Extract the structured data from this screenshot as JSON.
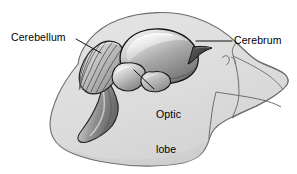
{
  "figure": {
    "name": "bird-brain-anatomy",
    "width": 297,
    "height": 174,
    "background_color": "#ffffff"
  },
  "labels": {
    "cerebellum": "Cerebellum",
    "cerebrum": "Cerebrum",
    "optic_lobe_line1": "Optic",
    "optic_lobe_line2": "lobe"
  },
  "colors": {
    "outline": "#5a5a5a",
    "head_fill": "#dcdcdc",
    "head_fill_shadow": "#cfcfcf",
    "brain_light": "#f2f2f2",
    "brain_mid": "#b0b0b0",
    "brain_dark": "#6e6e6e",
    "brain_outline": "#1a1a1a",
    "leader_line": "#1a1a1a",
    "text": "#000000"
  },
  "parts": [
    {
      "name": "head-outline",
      "label": ""
    },
    {
      "name": "upper-beak",
      "label": ""
    },
    {
      "name": "lower-beak",
      "label": ""
    },
    {
      "name": "nostril",
      "label": ""
    },
    {
      "name": "cerebrum",
      "label": "Cerebrum"
    },
    {
      "name": "cerebellum",
      "label": "Cerebellum"
    },
    {
      "name": "optic-lobe",
      "label": "Optic lobe"
    },
    {
      "name": "brain-stem",
      "label": ""
    },
    {
      "name": "olfactory-tract",
      "label": ""
    }
  ]
}
